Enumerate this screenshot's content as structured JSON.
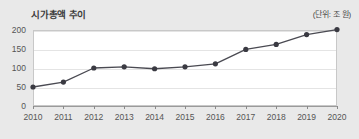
{
  "chart_data": {
    "type": "line",
    "title": "시가총액 추이",
    "unit_note": "(단위: 조 원)",
    "xlabel": "",
    "ylabel": "",
    "categories": [
      "2010",
      "2011",
      "2012",
      "2013",
      "2014",
      "2015",
      "2016",
      "2017",
      "2018",
      "2019",
      "2020"
    ],
    "values": [
      50,
      63,
      100,
      103,
      98,
      103,
      111,
      149,
      162,
      188,
      201
    ],
    "series": [
      {
        "name": "시가총액",
        "values": [
          50,
          63,
          100,
          103,
          98,
          103,
          111,
          149,
          162,
          188,
          201
        ]
      }
    ],
    "ylim": [
      0,
      200
    ],
    "y_ticks": [
      "0",
      "50",
      "100",
      "150",
      "200"
    ],
    "y_tick_values": [
      0,
      50,
      100,
      150,
      200
    ],
    "grid": true,
    "legend": false,
    "markers": true,
    "line_color": "#4a4a52",
    "marker_color": "#3a3a42",
    "grid_color": "#e4e4e4",
    "plot_background": "#ffffff",
    "page_background": "#e9e9e9",
    "axis_text_color": "#555555",
    "title_color": "#3c3c3c"
  }
}
